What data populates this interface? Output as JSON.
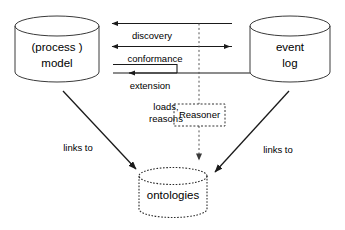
{
  "diagram": {
    "type": "process-mining-ontology-diagram",
    "background_color": "#ffffff",
    "stroke_color": "#1a1a1a",
    "nodes": {
      "process_model": {
        "shape": "cylinder",
        "line1": "(process )",
        "line2": "model",
        "border_style": "solid"
      },
      "event_log": {
        "shape": "cylinder",
        "line1": "event",
        "line2": "log",
        "border_style": "solid"
      },
      "ontologies": {
        "shape": "cylinder",
        "line1": "ontologies",
        "border_style": "dotted"
      },
      "reasoner": {
        "shape": "dashed-box",
        "label": "Reasoner",
        "border_style": "dashed"
      }
    },
    "edges": [
      {
        "id": "discovery",
        "label": "discovery",
        "direction": "right-to-left",
        "style": "solid"
      },
      {
        "id": "conformance",
        "label": "conformance",
        "direction": "bidirectional",
        "style": "solid"
      },
      {
        "id": "extension",
        "label": "extension",
        "direction": "right-to-left-bent",
        "style": "solid"
      },
      {
        "id": "loads-reasons",
        "label_line1": "loads,",
        "label_line2": "reasons",
        "direction": "downward",
        "style": "dashed"
      },
      {
        "id": "model-links-to-ontologies",
        "label": "links to",
        "direction": "diagonal-down-right",
        "style": "solid"
      },
      {
        "id": "log-links-to-ontologies",
        "label": "links to",
        "direction": "diagonal-down-left",
        "style": "solid"
      }
    ]
  }
}
